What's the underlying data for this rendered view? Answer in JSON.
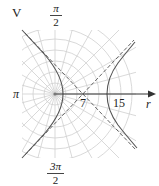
{
  "figure": {
    "panel_label": "V",
    "angle_labels": {
      "top": {
        "numerator": "π",
        "denominator": "2"
      },
      "left": "π",
      "bottom": {
        "numerator": "3π",
        "denominator": "2"
      }
    },
    "axis_label": "r",
    "tick_labels": [
      "7",
      "15"
    ],
    "colors": {
      "grid": "#c8c8c8",
      "curve": "#555555",
      "axis": "#333333"
    }
  }
}
